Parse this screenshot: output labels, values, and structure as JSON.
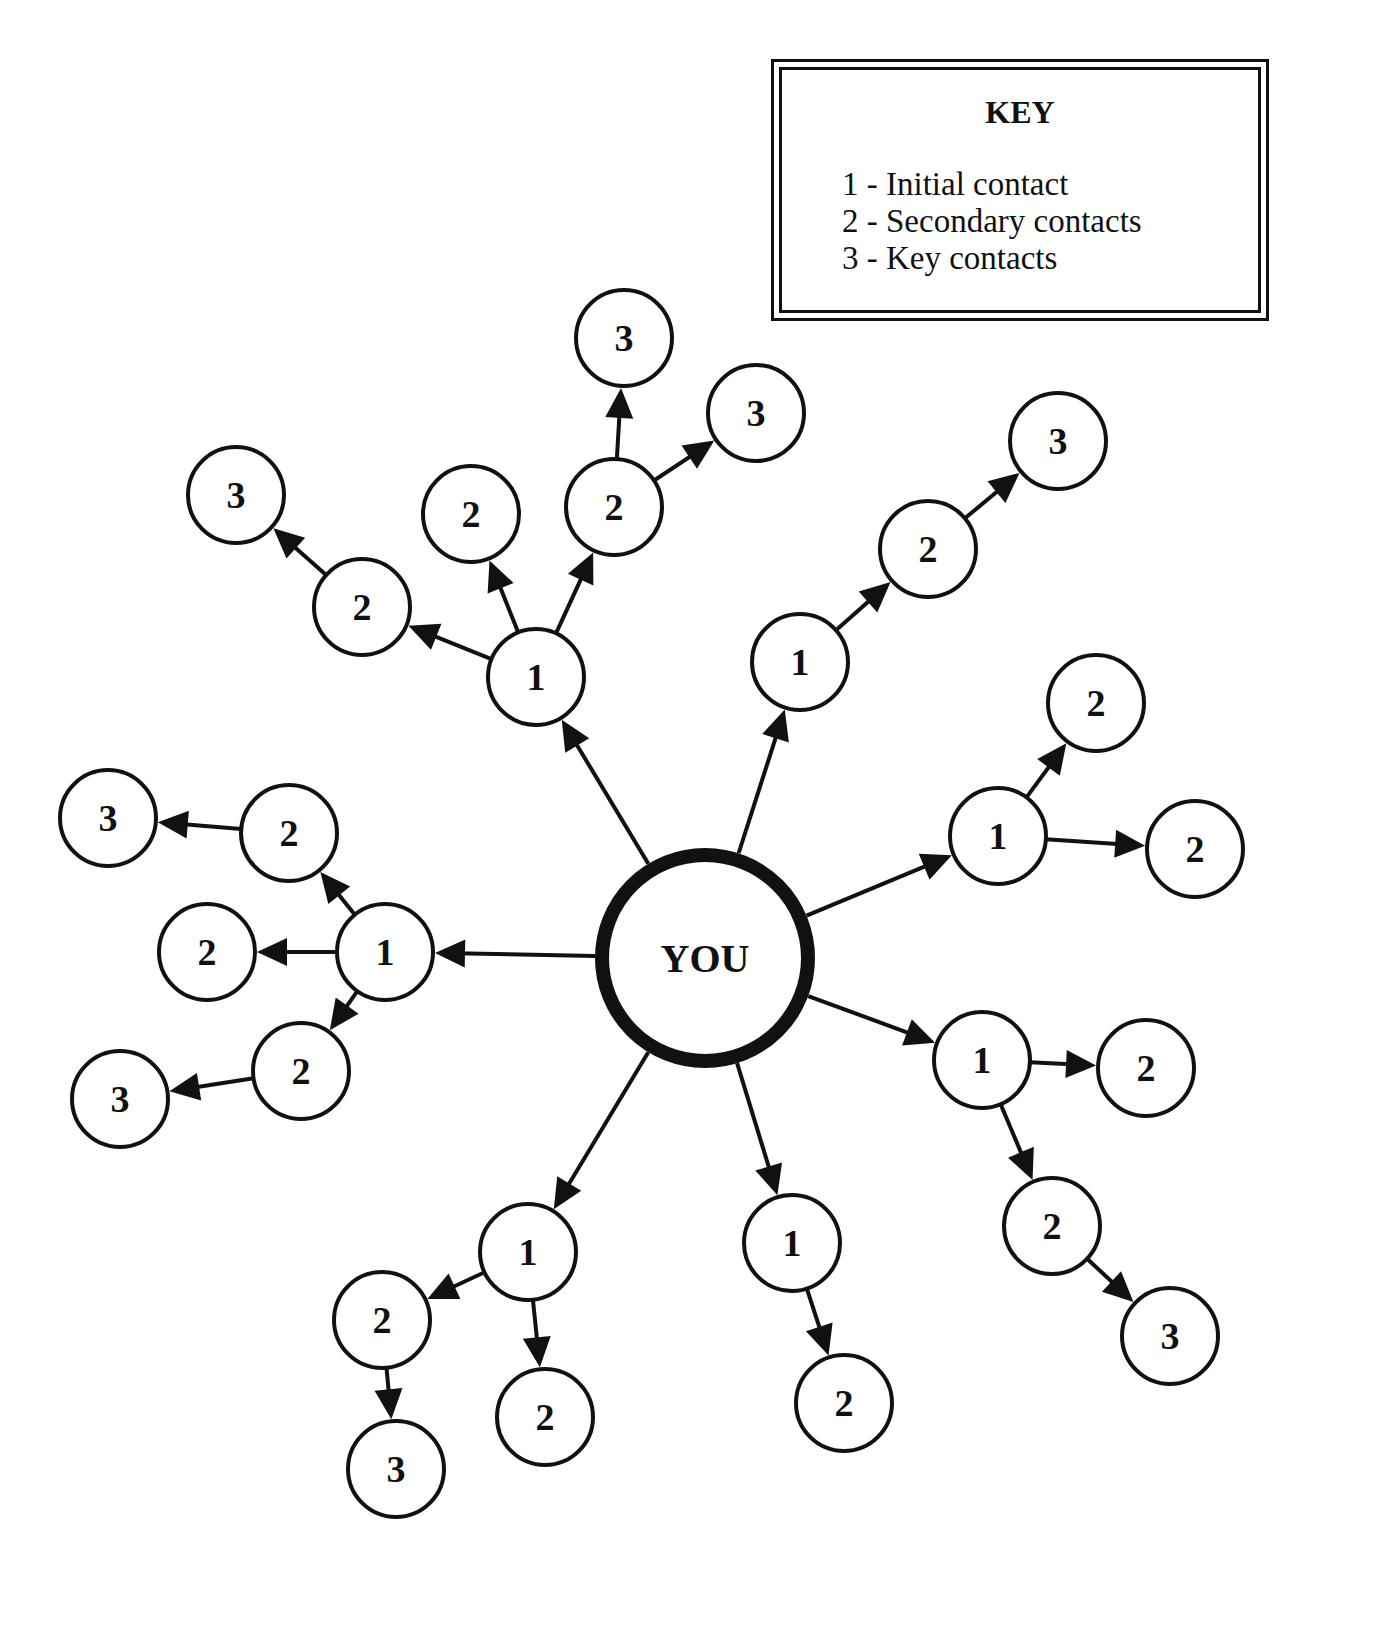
{
  "key": {
    "title": "KEY",
    "items": [
      {
        "level": "1",
        "label": "1 - Initial contact"
      },
      {
        "level": "2",
        "label": "2 - Secondary contacts"
      },
      {
        "level": "3",
        "label": "3 - Key contacts"
      }
    ]
  },
  "center": {
    "label": "YOU",
    "x": 705,
    "y": 958,
    "r": 103
  },
  "colors": {
    "stroke": "#111111",
    "background": "#ffffff"
  },
  "nodes": [
    {
      "id": "t1",
      "label": "1",
      "x": 536,
      "y": 677
    },
    {
      "id": "t2a",
      "label": "2",
      "x": 362,
      "y": 607
    },
    {
      "id": "t3a",
      "label": "3",
      "x": 236,
      "y": 495
    },
    {
      "id": "t2b",
      "label": "2",
      "x": 471,
      "y": 514
    },
    {
      "id": "t2c",
      "label": "2",
      "x": 614,
      "y": 507
    },
    {
      "id": "t3b",
      "label": "3",
      "x": 624,
      "y": 338
    },
    {
      "id": "t3c",
      "label": "3",
      "x": 756,
      "y": 413
    },
    {
      "id": "u1",
      "label": "1",
      "x": 800,
      "y": 662
    },
    {
      "id": "u2",
      "label": "2",
      "x": 928,
      "y": 549
    },
    {
      "id": "u3",
      "label": "3",
      "x": 1058,
      "y": 441
    },
    {
      "id": "r1",
      "label": "1",
      "x": 998,
      "y": 836
    },
    {
      "id": "r2a",
      "label": "2",
      "x": 1096,
      "y": 703
    },
    {
      "id": "r2b",
      "label": "2",
      "x": 1195,
      "y": 849
    },
    {
      "id": "lr1",
      "label": "1",
      "x": 982,
      "y": 1060
    },
    {
      "id": "lr2a",
      "label": "2",
      "x": 1146,
      "y": 1068
    },
    {
      "id": "lr2b",
      "label": "2",
      "x": 1052,
      "y": 1226
    },
    {
      "id": "lr3",
      "label": "3",
      "x": 1170,
      "y": 1336
    },
    {
      "id": "bm1",
      "label": "1",
      "x": 792,
      "y": 1243
    },
    {
      "id": "bm2",
      "label": "2",
      "x": 844,
      "y": 1403
    },
    {
      "id": "bl1",
      "label": "1",
      "x": 528,
      "y": 1252
    },
    {
      "id": "bl2a",
      "label": "2",
      "x": 382,
      "y": 1320
    },
    {
      "id": "bl2b",
      "label": "2",
      "x": 545,
      "y": 1417
    },
    {
      "id": "bl3",
      "label": "3",
      "x": 396,
      "y": 1469
    },
    {
      "id": "l1",
      "label": "1",
      "x": 385,
      "y": 952
    },
    {
      "id": "l2a",
      "label": "2",
      "x": 289,
      "y": 833
    },
    {
      "id": "l3a",
      "label": "3",
      "x": 108,
      "y": 818
    },
    {
      "id": "l2b",
      "label": "2",
      "x": 207,
      "y": 952
    },
    {
      "id": "l2c",
      "label": "2",
      "x": 301,
      "y": 1071
    },
    {
      "id": "l3c",
      "label": "3",
      "x": 120,
      "y": 1099
    }
  ],
  "edges": [
    [
      "center",
      "t1"
    ],
    [
      "t1",
      "t2a"
    ],
    [
      "t2a",
      "t3a"
    ],
    [
      "t1",
      "t2b"
    ],
    [
      "t1",
      "t2c"
    ],
    [
      "t2c",
      "t3b"
    ],
    [
      "t2c",
      "t3c"
    ],
    [
      "center",
      "u1"
    ],
    [
      "u1",
      "u2"
    ],
    [
      "u2",
      "u3"
    ],
    [
      "center",
      "r1"
    ],
    [
      "r1",
      "r2a"
    ],
    [
      "r1",
      "r2b"
    ],
    [
      "center",
      "lr1"
    ],
    [
      "lr1",
      "lr2a"
    ],
    [
      "lr1",
      "lr2b"
    ],
    [
      "lr2b",
      "lr3"
    ],
    [
      "center",
      "bm1"
    ],
    [
      "bm1",
      "bm2"
    ],
    [
      "center",
      "bl1"
    ],
    [
      "bl1",
      "bl2a"
    ],
    [
      "bl1",
      "bl2b"
    ],
    [
      "bl2a",
      "bl3"
    ],
    [
      "center",
      "l1"
    ],
    [
      "l1",
      "l2a"
    ],
    [
      "l2a",
      "l3a"
    ],
    [
      "l1",
      "l2b"
    ],
    [
      "l1",
      "l2c"
    ],
    [
      "l2c",
      "l3c"
    ]
  ]
}
